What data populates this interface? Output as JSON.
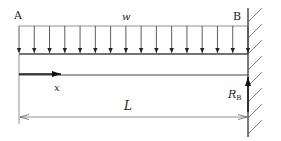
{
  "diagram": {
    "type": "cantilever-beam-uniform-load",
    "labels": {
      "left_end": "A",
      "right_end": "B",
      "load": "w",
      "axis": "x",
      "length": "L",
      "reaction_main": "R",
      "reaction_sub": "B"
    },
    "load_arrow_count": 16,
    "colors": {
      "line": "#333333",
      "thin_line": "#555555",
      "hatch": "#555555",
      "background": "#ffffff"
    }
  }
}
